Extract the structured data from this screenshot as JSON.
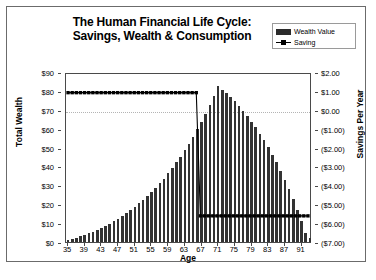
{
  "chart_data": {
    "type": "bar",
    "title": "The Human Financial Life Cycle: Savings, Wealth & Consumption",
    "title_line1": "The Human Financial Life Cycle:",
    "title_line2": "Savings, Wealth & Consumption",
    "xlabel": "Age",
    "ylabel": "Total Wealth",
    "y2label": "Savings Per Year",
    "ylim": [
      0,
      90
    ],
    "y2lim": [
      -7,
      2
    ],
    "y_ticks": [
      "$0",
      "$10",
      "$20",
      "$30",
      "$40",
      "$50",
      "$60",
      "$70",
      "$80",
      "$90"
    ],
    "y_tick_values": [
      0,
      10,
      20,
      30,
      40,
      50,
      60,
      70,
      80,
      90
    ],
    "y2_ticks": [
      "($7.00)",
      "($6.00)",
      "($5.00)",
      "($4.00)",
      "($3.00)",
      "($2.00)",
      "($1.00)",
      "$0.00",
      "$1.00",
      "$2.00"
    ],
    "y2_tick_values": [
      -7,
      -6,
      -5,
      -4,
      -3,
      -2,
      -1,
      0,
      1,
      2
    ],
    "x_ticks": [
      35,
      39,
      43,
      47,
      51,
      55,
      59,
      63,
      67,
      71,
      75,
      79,
      83,
      87,
      91
    ],
    "grid": "dotted gridline at $70 / $0.00",
    "legend_position": "top-right",
    "legend": [
      {
        "name": "Wealth Value",
        "marker": "bar",
        "color": "#333333"
      },
      {
        "name": "Saving",
        "marker": "line-with-square",
        "color": "#000000"
      }
    ],
    "x": [
      35,
      36,
      37,
      38,
      39,
      40,
      41,
      42,
      43,
      44,
      45,
      46,
      47,
      48,
      49,
      50,
      51,
      52,
      53,
      54,
      55,
      56,
      57,
      58,
      59,
      60,
      61,
      62,
      63,
      64,
      65,
      66,
      67,
      68,
      69,
      70,
      71,
      72,
      73,
      74,
      75,
      76,
      77,
      78,
      79,
      80,
      81,
      82,
      83,
      84,
      85,
      86,
      87,
      88,
      89,
      90,
      91,
      92,
      93
    ],
    "series": [
      {
        "name": "Wealth Value",
        "axis": "left",
        "color": "#333333",
        "values": [
          1.0,
          1.6,
          2.3,
          3.0,
          3.8,
          4.6,
          5.5,
          6.5,
          7.5,
          8.6,
          9.8,
          11.0,
          12.4,
          13.8,
          15.3,
          16.9,
          18.6,
          20.4,
          22.3,
          24.3,
          26.5,
          28.7,
          31.1,
          33.6,
          36.3,
          39.1,
          42.1,
          45.2,
          48.5,
          52.0,
          55.7,
          59.6,
          63.7,
          68.0,
          72.6,
          77.4,
          82.4,
          80.6,
          78.7,
          76.6,
          74.4,
          72.0,
          69.4,
          66.7,
          63.8,
          60.7,
          57.4,
          53.9,
          50.2,
          46.3,
          42.1,
          37.7,
          33.0,
          28.0,
          22.7,
          17.1,
          11.2,
          5.0,
          2.2
        ]
      },
      {
        "name": "Saving",
        "axis": "right",
        "color": "#000000",
        "values": [
          1.0,
          1.0,
          1.0,
          1.0,
          1.0,
          1.0,
          1.0,
          1.0,
          1.0,
          1.0,
          1.0,
          1.0,
          1.0,
          1.0,
          1.0,
          1.0,
          1.0,
          1.0,
          1.0,
          1.0,
          1.0,
          1.0,
          1.0,
          1.0,
          1.0,
          1.0,
          1.0,
          1.0,
          1.0,
          1.0,
          1.0,
          1.0,
          -5.6,
          -5.6,
          -5.6,
          -5.6,
          -5.6,
          -5.6,
          -5.6,
          -5.6,
          -5.6,
          -5.6,
          -5.6,
          -5.6,
          -5.6,
          -5.6,
          -5.6,
          -5.6,
          -5.6,
          -5.6,
          -5.6,
          -5.6,
          -5.6,
          -5.6,
          -5.6,
          -5.6,
          -5.6,
          -5.6,
          -5.6
        ]
      }
    ]
  }
}
